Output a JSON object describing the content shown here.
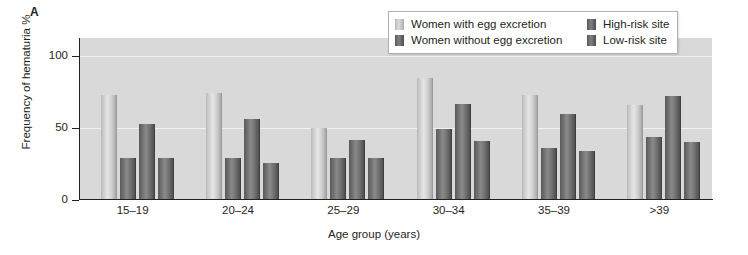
{
  "panel": {
    "label": "A"
  },
  "legend": {
    "entries": [
      {
        "label": "Women with egg excretion",
        "swatch": "light"
      },
      {
        "label": "Women without egg excretion",
        "swatch": "dark"
      },
      {
        "label": "High-risk site",
        "swatch": "dark"
      },
      {
        "label": "Low-risk site",
        "swatch": "dark"
      }
    ]
  },
  "axes": {
    "y_ticks": [
      "0",
      "50",
      "100"
    ],
    "y_title": "Frequency of hematuria %",
    "x_title": "Age group (years)"
  },
  "colors": {
    "plot_background": "#d9d9d9",
    "gridline": "#f2f2f2",
    "axis": "#231f20",
    "bar_light": "#d2d2d2",
    "bar_dark": "#6e6e6e"
  },
  "chart_data": {
    "type": "bar",
    "title": "",
    "xlabel": "Age group (years)",
    "ylabel": "Frequency of hematuria %",
    "ylim": [
      0,
      110
    ],
    "yticks": [
      0,
      50,
      100
    ],
    "grid": true,
    "legend_position": "top-right",
    "categories": [
      "15–19",
      "20–24",
      "25–29",
      "30–34",
      "35–39",
      ">39"
    ],
    "series": [
      {
        "name": "Women with egg excretion",
        "shade": "light",
        "values": [
          73,
          74,
          50,
          85,
          73,
          66
        ]
      },
      {
        "name": "Women without egg excretion",
        "shade": "dark",
        "values": [
          29,
          29,
          29,
          49,
          36,
          44
        ]
      },
      {
        "name": "High-risk site",
        "shade": "dark",
        "values": [
          53,
          56,
          42,
          67,
          60,
          72
        ]
      },
      {
        "name": "Low-risk site",
        "shade": "dark",
        "values": [
          29,
          26,
          29,
          41,
          34,
          40
        ]
      }
    ]
  }
}
